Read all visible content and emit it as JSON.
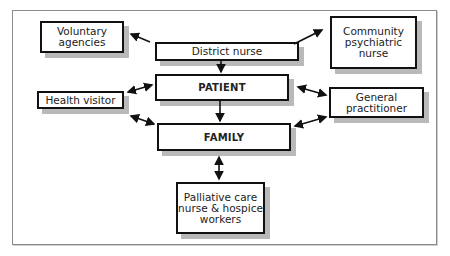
{
  "diagram": {
    "nodes": {
      "voluntary_agencies": "Voluntary\nagencies",
      "district_nurse": "District nurse",
      "community_psychiatric_nurse": "Community\npsychiatric\nnurse",
      "patient": "PATIENT",
      "health_visitor": "Health visitor",
      "general_practitioner": "General\npractitioner",
      "family": "FAMILY",
      "palliative_care": "Palliative care\nnurse & hospice\nworkers"
    },
    "edges": [
      {
        "from": "District nurse",
        "to": "Voluntary agencies",
        "direction": "one-way"
      },
      {
        "from": "District nurse",
        "to": "Community psychiatric nurse",
        "direction": "one-way"
      },
      {
        "from": "District nurse",
        "to": "PATIENT",
        "direction": "one-way"
      },
      {
        "from": "PATIENT",
        "to": "FAMILY",
        "direction": "one-way"
      },
      {
        "from": "Health visitor",
        "to": "PATIENT",
        "direction": "two-way"
      },
      {
        "from": "Health visitor",
        "to": "FAMILY",
        "direction": "two-way"
      },
      {
        "from": "General practitioner",
        "to": "PATIENT",
        "direction": "two-way"
      },
      {
        "from": "General practitioner",
        "to": "FAMILY",
        "direction": "two-way"
      },
      {
        "from": "FAMILY",
        "to": "Palliative care nurse & hospice workers",
        "direction": "two-way"
      }
    ],
    "colors": {
      "border": "#111111",
      "shadow": "#b9b9b9",
      "frame": "#8a8a8a"
    }
  }
}
